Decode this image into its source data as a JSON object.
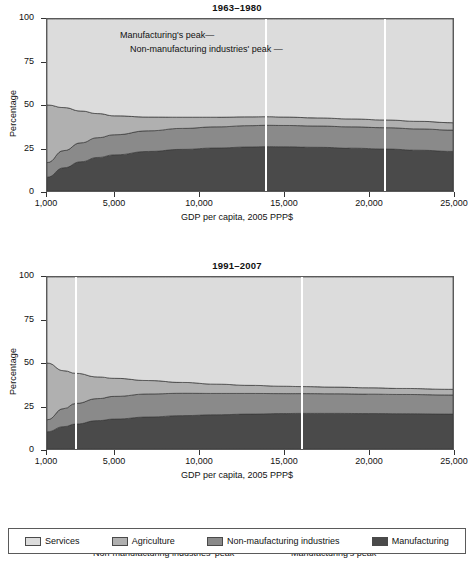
{
  "figure": {
    "xaxis_title": "GDP per capita, 2005 PPP$",
    "yaxis_title": "Percentage"
  },
  "legend": {
    "items": [
      {
        "label": "Services",
        "color": "#dcdcdc"
      },
      {
        "label": "Agriculture",
        "color": "#b0b0b0"
      },
      {
        "label": "Non-maufacturing industries",
        "color": "#8a8a8a"
      },
      {
        "label": "Manufacturing",
        "color": "#4a4a4a"
      }
    ]
  },
  "panels": [
    {
      "id": "top",
      "title": "1963–1980",
      "annotations": [
        {
          "text": "Manufacturing's peak—",
          "target_x": 13900
        },
        {
          "text": "Non-manufacturing industries' peak —",
          "target_x": 20900
        }
      ],
      "markers": [
        {
          "label": "Manufacturing's peak",
          "x": 13900
        },
        {
          "label": "Non-manufacturing industries' peak",
          "x": 20900
        }
      ],
      "xticks": [
        "1,000",
        "5,000",
        "10,000",
        "15,000",
        "20,000",
        "25,000"
      ],
      "yticks": [
        "0",
        "25",
        "50",
        "75",
        "100"
      ]
    },
    {
      "id": "bottom",
      "title": "1991–2007",
      "annotations": [
        {
          "text": "—Non-manufacturing industries' peak",
          "target_x": 2700
        },
        {
          "text": "—Manufacturing's peak",
          "target_x": 16000
        }
      ],
      "markers": [
        {
          "label": "Non-manufacturing industries' peak",
          "x": 2700
        },
        {
          "label": "Manufacturing's peak",
          "x": 16000
        }
      ],
      "xticks": [
        "1,000",
        "5,000",
        "10,000",
        "15,000",
        "20,000",
        "25,000"
      ],
      "yticks": [
        "0",
        "25",
        "50",
        "75",
        "100"
      ]
    }
  ],
  "chart_data": [
    {
      "type": "area",
      "title": "1963–1980",
      "xlabel": "GDP per capita, 2005 PPP$",
      "ylabel": "Percentage",
      "xlim": [
        1000,
        25000
      ],
      "ylim": [
        0,
        100
      ],
      "xticks": [
        1000,
        5000,
        10000,
        15000,
        20000,
        25000
      ],
      "yticks": [
        0,
        25,
        50,
        75,
        100
      ],
      "grid": false,
      "legend_position": "bottom",
      "stacked": true,
      "x": [
        1000,
        2000,
        3000,
        4000,
        5000,
        7000,
        9000,
        11000,
        13000,
        14000,
        15000,
        17000,
        19000,
        21000,
        23000,
        25000
      ],
      "series": [
        {
          "name": "Manufacturing",
          "color": "#4a4a4a",
          "values": [
            8.0,
            13.5,
            17.0,
            19.5,
            21.0,
            23.0,
            24.2,
            25.0,
            25.6,
            25.8,
            25.7,
            25.4,
            24.9,
            24.4,
            23.7,
            23.0
          ]
        },
        {
          "name": "Non-maufacturing industries",
          "color": "#8a8a8a",
          "values": [
            8.5,
            10.0,
            11.0,
            11.5,
            11.7,
            12.0,
            12.2,
            12.3,
            12.4,
            12.4,
            12.4,
            12.4,
            12.4,
            12.4,
            12.4,
            12.4
          ]
        },
        {
          "name": "Agriculture",
          "color": "#b0b0b0",
          "values": [
            33.5,
            25.0,
            18.5,
            14.0,
            11.0,
            8.0,
            6.5,
            5.6,
            5.1,
            5.0,
            4.9,
            4.7,
            4.6,
            4.5,
            4.4,
            4.3
          ]
        },
        {
          "name": "Services",
          "color": "#dcdcdc",
          "values": [
            50.0,
            51.5,
            53.5,
            55.0,
            56.3,
            57.0,
            57.1,
            57.1,
            56.9,
            56.8,
            57.0,
            57.5,
            58.1,
            58.7,
            59.5,
            60.3
          ]
        }
      ],
      "annotations": [
        {
          "text": "Manufacturing's peak",
          "x": 13900
        },
        {
          "text": "Non-manufacturing industries' peak",
          "x": 20900
        }
      ]
    },
    {
      "type": "area",
      "title": "1991–2007",
      "xlabel": "GDP per capita, 2005 PPP$",
      "ylabel": "Percentage",
      "xlim": [
        1000,
        25000
      ],
      "ylim": [
        0,
        100
      ],
      "xticks": [
        1000,
        5000,
        10000,
        15000,
        20000,
        25000
      ],
      "yticks": [
        0,
        25,
        50,
        75,
        100
      ],
      "grid": false,
      "legend_position": "bottom",
      "stacked": true,
      "x": [
        1000,
        2000,
        2700,
        4000,
        5000,
        7000,
        9000,
        11000,
        13000,
        15000,
        16000,
        18000,
        20000,
        22000,
        25000
      ],
      "series": [
        {
          "name": "Manufacturing",
          "color": "#4a4a4a",
          "values": [
            10.0,
            13.0,
            14.5,
            16.5,
            17.4,
            18.6,
            19.4,
            19.9,
            20.3,
            20.6,
            20.7,
            20.7,
            20.6,
            20.5,
            20.3
          ]
        },
        {
          "name": "Non-maufacturing industries",
          "color": "#8a8a8a",
          "values": [
            7.0,
            10.5,
            12.0,
            12.8,
            13.2,
            13.4,
            13.0,
            12.4,
            12.0,
            11.6,
            11.5,
            11.4,
            11.3,
            11.2,
            11.1
          ]
        },
        {
          "name": "Agriculture",
          "color": "#b0b0b0",
          "values": [
            33.0,
            22.0,
            17.5,
            12.6,
            10.5,
            7.8,
            6.3,
            5.4,
            4.7,
            4.3,
            4.1,
            3.9,
            3.7,
            3.5,
            3.3
          ]
        },
        {
          "name": "Services",
          "color": "#dcdcdc",
          "values": [
            50.0,
            54.5,
            56.0,
            58.1,
            58.9,
            60.2,
            61.3,
            62.3,
            63.0,
            63.5,
            63.7,
            64.0,
            64.4,
            64.8,
            65.3
          ]
        }
      ],
      "annotations": [
        {
          "text": "Non-manufacturing industries' peak",
          "x": 2700
        },
        {
          "text": "Manufacturing's peak",
          "x": 16000
        }
      ]
    }
  ]
}
